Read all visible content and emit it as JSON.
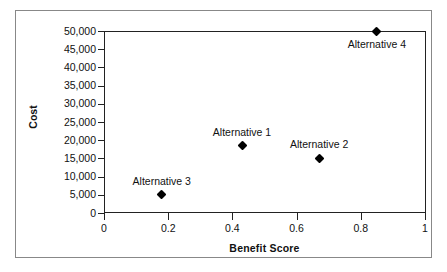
{
  "chart_data": {
    "type": "scatter",
    "title": "",
    "xlabel": "Benefit Score",
    "ylabel": "Cost",
    "xlim": [
      0,
      1
    ],
    "ylim": [
      0,
      50000
    ],
    "grid": false,
    "legend": false,
    "x_ticks": [
      "0",
      "0.2",
      "0.4",
      "0.6",
      "0.8",
      "1"
    ],
    "x_tick_values": [
      0,
      0.2,
      0.4,
      0.6,
      0.8,
      1
    ],
    "y_ticks": [
      "0",
      "5,000",
      "10,000",
      "15,000",
      "20,000",
      "25,000",
      "30,000",
      "35,000",
      "40,000",
      "45,000",
      "50,000"
    ],
    "y_tick_values": [
      0,
      5000,
      10000,
      15000,
      20000,
      25000,
      30000,
      35000,
      40000,
      45000,
      50000
    ],
    "points": [
      {
        "label": "Alternative 3",
        "x": 0.18,
        "y": 5000,
        "label_position": "above"
      },
      {
        "label": "Alternative 1",
        "x": 0.43,
        "y": 18500,
        "label_position": "above"
      },
      {
        "label": "Alternative 2",
        "x": 0.67,
        "y": 15000,
        "label_position": "above"
      },
      {
        "label": "Alternative 4",
        "x": 0.85,
        "y": 50000,
        "label_position": "below"
      }
    ],
    "marker": "diamond",
    "marker_color": "#000000"
  }
}
